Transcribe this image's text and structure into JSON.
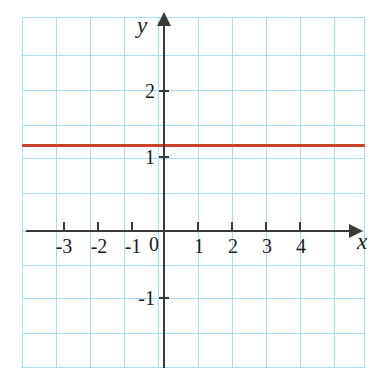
{
  "figure": {
    "kind": "cartesian-graph",
    "width": 385,
    "height": 386,
    "background": "#ffffff"
  },
  "colors": {
    "grid": "#a8dcee",
    "axis": "#3a3a3a",
    "series": "#c8432a",
    "text": "#1c1c1c"
  },
  "axis_names": {
    "x": "x",
    "y": "y"
  },
  "origin_label": "0",
  "x_tick_labels": [
    "-3",
    "-2",
    "-1",
    "1",
    "2",
    "3",
    "4"
  ],
  "y_tick_labels": [
    "2",
    "1",
    "-1"
  ],
  "chart_data": {
    "type": "line",
    "title": "",
    "subtitle": "",
    "xlabel": "x",
    "ylabel": "y",
    "xlim": [
      -3.7,
      5.3
    ],
    "ylim": [
      -2.2,
      2.85
    ],
    "xticks": [
      -3,
      -2,
      -1,
      0,
      1,
      2,
      3,
      4
    ],
    "yticks": [
      -1,
      0,
      1,
      2
    ],
    "xticklabels": [
      "-3",
      "-2",
      "-1",
      "0",
      "1",
      "2",
      "3",
      "4"
    ],
    "yticklabels": [
      "-1",
      "0",
      "1",
      "2"
    ],
    "grid": true,
    "grid_spacing_x": 0.5,
    "grid_spacing_y": 0.5,
    "legend": null,
    "legend_position": "none",
    "annotations": [],
    "series": [
      {
        "name": "y = 1",
        "color": "#c8432a",
        "equation": "y = 1",
        "x": [
          -3.7,
          5.3
        ],
        "values": [
          1,
          1
        ],
        "points": [
          {
            "x": -3.7,
            "y": 1
          },
          {
            "x": 5.3,
            "y": 1
          }
        ]
      }
    ]
  }
}
